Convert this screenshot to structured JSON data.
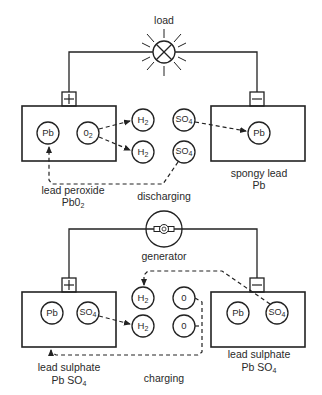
{
  "diagram": {
    "type": "lead-acid battery discharge/charge reaction",
    "discharging": {
      "caption": "discharging",
      "load_label": "load",
      "positive_terminal": "+",
      "negative_terminal": "−",
      "positive_plate": {
        "atoms": [
          "Pb",
          "O2"
        ],
        "label_line1": "lead peroxide",
        "label_line2": "PbO2"
      },
      "electrolyte": [
        "H2",
        "H2",
        "SO4",
        "SO4"
      ],
      "negative_plate": {
        "atoms": [
          "Pb"
        ],
        "label_line1": "spongy lead",
        "label_line2": "Pb"
      }
    },
    "charging": {
      "caption": "charging",
      "source_label": "generator",
      "positive_terminal": "+",
      "negative_terminal": "−",
      "positive_plate": {
        "atoms": [
          "Pb",
          "SO4"
        ],
        "label_line1": "lead sulphate",
        "label_line2": "Pb SO4"
      },
      "electrolyte": [
        "H2",
        "H2",
        "0",
        "0"
      ],
      "negative_plate": {
        "atoms": [
          "Pb",
          "SO4"
        ],
        "label_line1": "lead sulphate",
        "label_line2": "Pb SO4"
      }
    },
    "colors": {
      "ink": "#222222",
      "background": "#ffffff"
    }
  },
  "text": {
    "load": "load",
    "discharging": "discharging",
    "generator": "generator",
    "charging": "charging",
    "plus": "+",
    "minus": "−",
    "pb": "Pb",
    "h": "H",
    "two": "2",
    "so": "SO",
    "four": "4",
    "o": "0",
    "lead_peroxide": "lead peroxide",
    "pbo": "Pb0",
    "spongy_lead": "spongy lead",
    "lead_sulphate": "lead sulphate",
    "pb_so": "Pb SO"
  }
}
